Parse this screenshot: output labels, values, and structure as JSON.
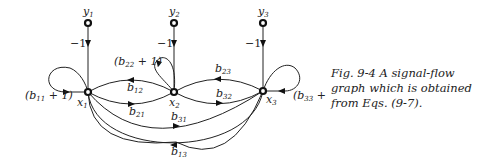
{
  "figure": {
    "nodes": {
      "y1": {
        "label": "y",
        "sub": "1"
      },
      "y2": {
        "label": "y",
        "sub": "2"
      },
      "y3": {
        "label": "y",
        "sub": "3"
      },
      "x1": {
        "label": "x",
        "sub": "1"
      },
      "x2": {
        "label": "x",
        "sub": "2"
      },
      "x3": {
        "label": "x",
        "sub": "3"
      }
    },
    "input_gains": {
      "y1_x1": "−1",
      "y2_x2": "−1",
      "y3_x3": "−1"
    },
    "self_loops": {
      "x1": {
        "pre": "(b",
        "sub": "11",
        "post": " + 1)"
      },
      "x2": {
        "pre": "(b",
        "sub": "22",
        "post": " + 1)"
      },
      "x3": {
        "pre": "(b",
        "sub": "33",
        "post": " + 1)"
      }
    },
    "edges": {
      "b12": {
        "label": "b",
        "sub": "12"
      },
      "b21": {
        "label": "b",
        "sub": "21"
      },
      "b23": {
        "label": "b",
        "sub": "23"
      },
      "b32": {
        "label": "b",
        "sub": "32"
      },
      "b31": {
        "label": "b",
        "sub": "31"
      },
      "b13": {
        "label": "b",
        "sub": "13"
      }
    }
  },
  "caption": {
    "line1": "Fig. 9-4  A signal-flow",
    "line2": "graph which is obtained",
    "line3": "from Eqs. (9-7)."
  }
}
